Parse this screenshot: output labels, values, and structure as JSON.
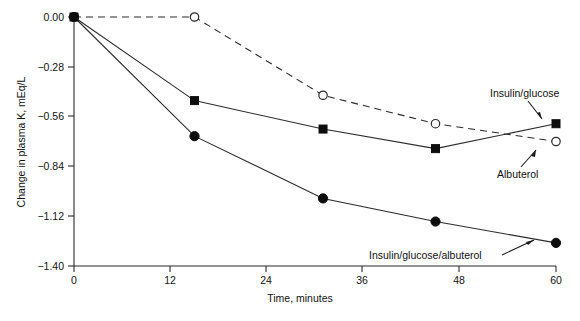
{
  "chart_data": {
    "type": "line",
    "title": "",
    "xlabel": "Time, minutes",
    "ylabel": "Change in plasma K, mEq/L",
    "xlim": [
      0,
      60
    ],
    "ylim": [
      -1.4,
      0.0
    ],
    "xticks": [
      "0",
      "12",
      "24",
      "36",
      "48",
      "60"
    ],
    "xtick_values": [
      0,
      12,
      24,
      36,
      48,
      60
    ],
    "yticks": [
      "0.00",
      "−0.28",
      "−0.56",
      "−0.84",
      "−1.12",
      "−1.40"
    ],
    "ytick_values": [
      0.0,
      -0.28,
      -0.56,
      -0.84,
      -1.12,
      -1.4
    ],
    "grid": false,
    "legend_position": "inline-annotations",
    "series": [
      {
        "name": "Insulin/glucose",
        "marker": "filled-square",
        "line_style": "solid",
        "x": [
          0,
          15,
          31,
          45,
          60
        ],
        "values": [
          0.0,
          -0.47,
          -0.63,
          -0.74,
          -0.6
        ]
      },
      {
        "name": "Albuterol",
        "marker": "open-circle",
        "line_style": "dashed",
        "x": [
          0,
          15,
          31,
          45,
          60
        ],
        "values": [
          0.0,
          0.0,
          -0.44,
          -0.6,
          -0.7
        ]
      },
      {
        "name": "Insulin/glucose/albuterol",
        "marker": "filled-circle",
        "line_style": "solid",
        "x": [
          0,
          15,
          31,
          45,
          60
        ],
        "values": [
          0.0,
          -0.67,
          -1.02,
          -1.15,
          -1.27
        ]
      }
    ],
    "annotations": [
      {
        "id": "insulin-glucose",
        "text": "Insulin/glucose"
      },
      {
        "id": "albuterol",
        "text": "Albuterol"
      },
      {
        "id": "insulin-glucose-albuterol",
        "text": "Insulin/glucose/albuterol"
      }
    ]
  },
  "axes": {
    "y_title": "Change in plasma K, mEq/L",
    "x_title": "Time, minutes",
    "y_tick_0": "0.00",
    "y_tick_1": "−0.28",
    "y_tick_2": "−0.56",
    "y_tick_3": "−0.84",
    "y_tick_4": "−1.12",
    "y_tick_5": "−1.40",
    "x_tick_0": "0",
    "x_tick_1": "12",
    "x_tick_2": "24",
    "x_tick_3": "36",
    "x_tick_4": "48",
    "x_tick_5": "60"
  },
  "labels": {
    "insulin_glucose": "Insulin/glucose",
    "albuterol": "Albuterol",
    "insulin_glucose_albuterol": "Insulin/glucose/albuterol"
  },
  "colors": {
    "ink": "#2b2b2b",
    "marker_fill": "#0d0d0d",
    "background": "#ffffff"
  }
}
